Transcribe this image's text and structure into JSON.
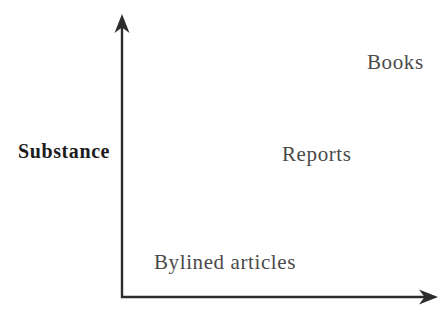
{
  "diagram": {
    "type": "two-axis-positioning-diagram",
    "background_color": "#ffffff",
    "axis": {
      "color": "#2d2d2d",
      "y_label": "Substance",
      "x_label": ""
    },
    "colors": {
      "axis": "#2d2d2d",
      "item_label": "#4a4a4a",
      "axis_label": "#1d1d1d"
    },
    "items": [
      {
        "label": "Bylined articles",
        "substance": "low"
      },
      {
        "label": "Reports",
        "substance": "medium"
      },
      {
        "label": "Books",
        "substance": "high"
      }
    ]
  }
}
